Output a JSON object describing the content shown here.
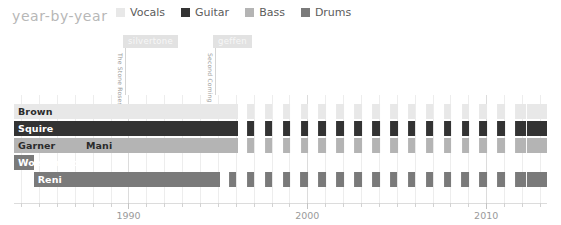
{
  "header": {
    "title": "year-by-year"
  },
  "legend": {
    "items": [
      {
        "label": "Vocals",
        "color": "#e8e8e8"
      },
      {
        "label": "Guitar",
        "color": "#333333"
      },
      {
        "label": "Bass",
        "color": "#b4b4b4"
      },
      {
        "label": "Drums",
        "color": "#7a7a7a"
      }
    ]
  },
  "annotations": [
    {
      "tag": "silvertone",
      "tag_color": "#e2e2e2",
      "tag_text_color": "#f7f7f7",
      "note": "The Stone Roses",
      "x": 123
    },
    {
      "tag": "geffen",
      "tag_color": "#e2e2e2",
      "tag_text_color": "#f7f7f7",
      "note": "Second Coming",
      "x": 213
    }
  ],
  "chart_data": {
    "type": "bar",
    "title": "year-by-year",
    "xlabel": "",
    "ylabel": "",
    "xlim": [
      1983.6,
      2013.4
    ],
    "grid": true,
    "legend_position": "top",
    "tick_labels": [
      "1990",
      "2000",
      "2010"
    ],
    "tick_values": [
      1990,
      2000,
      2010
    ],
    "minor_tick_interval": 1,
    "categories": [
      "Brown",
      "Squire",
      "Garner",
      "Mani",
      "Wolstencroft",
      "Reni"
    ],
    "series": [
      {
        "name": "Brown",
        "role": "Vocals",
        "color": "#e8e8e8",
        "row": 0,
        "segments": [
          {
            "label": "Brown",
            "start": 1983.6,
            "end": 1996.1,
            "style": "solid"
          },
          {
            "label": "",
            "start": 1996.1,
            "end": 2012.3,
            "style": "striped"
          },
          {
            "label": "",
            "start": 2012.3,
            "end": 2013.4,
            "style": "solid"
          }
        ]
      },
      {
        "name": "Squire",
        "role": "Guitar",
        "color": "#333333",
        "row": 1,
        "segments": [
          {
            "label": "Squire",
            "start": 1983.6,
            "end": 1996.1,
            "style": "solid"
          },
          {
            "label": "",
            "start": 1996.1,
            "end": 2012.3,
            "style": "striped"
          },
          {
            "label": "",
            "start": 2012.3,
            "end": 2013.4,
            "style": "solid"
          }
        ]
      },
      {
        "name": "Garner",
        "role": "Bass",
        "color": "#b4b4b4",
        "row": 2,
        "segments": [
          {
            "label": "Garner",
            "start": 1983.6,
            "end": 1987.4,
            "style": "solid"
          },
          {
            "label": "Mani",
            "start": 1987.4,
            "end": 1996.1,
            "style": "solid"
          },
          {
            "label": "",
            "start": 1996.1,
            "end": 2012.3,
            "style": "striped"
          },
          {
            "label": "",
            "start": 2012.3,
            "end": 2013.4,
            "style": "solid"
          }
        ]
      },
      {
        "name": "Wolstencroft",
        "role": "Drums",
        "color": "#7a7a7a",
        "row": 3,
        "segments": [
          {
            "label": "Wolstencroft",
            "start": 1983.6,
            "end": 1984.7,
            "style": "solid"
          }
        ]
      },
      {
        "name": "Reni",
        "role": "Drums",
        "color": "#7a7a7a",
        "row": 4,
        "segments": [
          {
            "label": "Reni",
            "start": 1984.7,
            "end": 1995.1,
            "style": "solid"
          },
          {
            "label": "",
            "start": 1995.1,
            "end": 2012.3,
            "style": "striped"
          },
          {
            "label": "",
            "start": 2012.3,
            "end": 2013.4,
            "style": "solid"
          }
        ]
      }
    ]
  }
}
